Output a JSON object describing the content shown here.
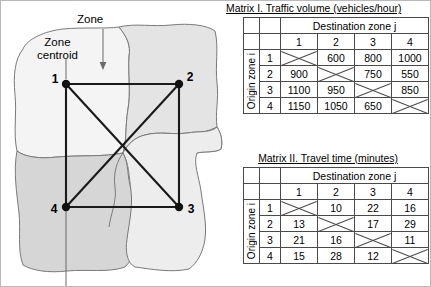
{
  "diagram": {
    "annotations": [
      {
        "name": "zone",
        "label": "Zone"
      },
      {
        "name": "zone-centroid",
        "label": "Zone\ncentroid"
      }
    ],
    "nodes": [
      {
        "id": "1",
        "label": "1",
        "x": 65,
        "y": 83
      },
      {
        "id": "2",
        "label": "2",
        "x": 178,
        "y": 83
      },
      {
        "id": "3",
        "label": "3",
        "x": 178,
        "y": 206
      },
      {
        "id": "4",
        "label": "4",
        "x": 65,
        "y": 206
      }
    ],
    "edges": [
      [
        "1",
        "2"
      ],
      [
        "2",
        "3"
      ],
      [
        "3",
        "4"
      ],
      [
        "4",
        "1"
      ],
      [
        "1",
        "3"
      ],
      [
        "2",
        "4"
      ]
    ],
    "colors": {
      "zone_fill_light": "#f4f4f4",
      "zone_fill_mid": "#e6e6e6",
      "zone_fill_dark": "#d6d6d6",
      "zone_stroke": "#7a7a7a",
      "network": "#1a1a1a"
    }
  },
  "matrices": [
    {
      "id": "matrix-1",
      "title": "Matrix I. Traffic volume (vehicles/hour)",
      "col_header": "Destination zone j",
      "row_header": "Origin zone i",
      "col_labels": [
        "1",
        "2",
        "3",
        "4"
      ],
      "row_labels": [
        "1",
        "2",
        "3",
        "4"
      ],
      "rows": [
        [
          "X",
          "600",
          "800",
          "1000"
        ],
        [
          "900",
          "X",
          "750",
          "550"
        ],
        [
          "1100",
          "950",
          "X",
          "850"
        ],
        [
          "1150",
          "1050",
          "650",
          "X"
        ]
      ]
    },
    {
      "id": "matrix-2",
      "title": "Matrix II. Travel time (minutes)",
      "col_header": "Destination zone j",
      "row_header": "Origin zone i",
      "col_labels": [
        "1",
        "2",
        "3",
        "4"
      ],
      "row_labels": [
        "1",
        "2",
        "3",
        "4"
      ],
      "rows": [
        [
          "X",
          "10",
          "22",
          "16"
        ],
        [
          "13",
          "X",
          "17",
          "29"
        ],
        [
          "21",
          "16",
          "X",
          "11"
        ],
        [
          "15",
          "28",
          "12",
          "X"
        ]
      ]
    }
  ]
}
